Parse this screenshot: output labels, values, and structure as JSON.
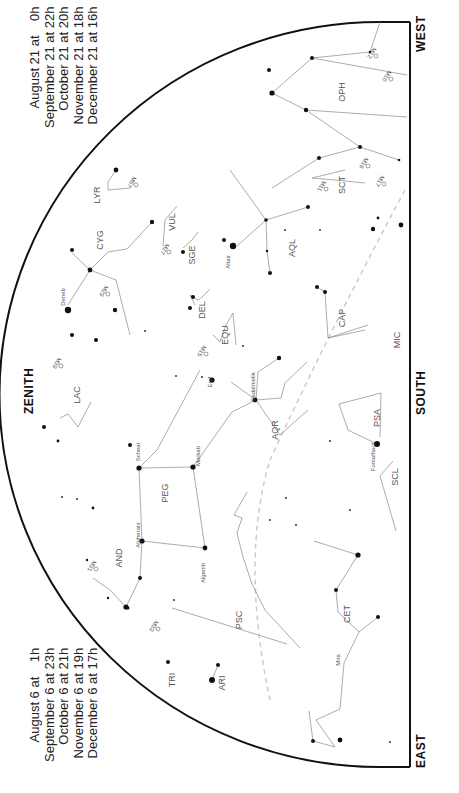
{
  "chart": {
    "title": "",
    "directions": {
      "zenith": "ZENITH",
      "south": "SOUTH",
      "west": "WEST",
      "east": "EAST"
    },
    "times_top": [
      "August 21 at    0h",
      "September 21 at 22h",
      "October 21 at 20h",
      "November 21 at 18h",
      "December 21 at 16h"
    ],
    "times_bottom": [
      "August 6 at    1h",
      "September 6 at 23h",
      "October 6 at 21h",
      "November 6 at 19h",
      "December 6 at 17h"
    ],
    "colors": {
      "border": "#111111",
      "lines": "#888888",
      "stars": "#111111",
      "ecliptic": "#cccccc",
      "labels": "#555555"
    }
  },
  "constellations": [
    {
      "abbr": "OPH",
      "x": 345,
      "y": 92
    },
    {
      "abbr": "SCT",
      "x": 345,
      "y": 185
    },
    {
      "abbr": "AQL",
      "x": 295,
      "y": 248
    },
    {
      "abbr": "CAP",
      "x": 345,
      "y": 318
    },
    {
      "abbr": "MIC",
      "x": 400,
      "y": 340
    },
    {
      "abbr": "LYR",
      "x": 100,
      "y": 195
    },
    {
      "abbr": "CYG",
      "x": 103,
      "y": 240
    },
    {
      "abbr": "VUL",
      "x": 175,
      "y": 222
    },
    {
      "abbr": "SGE",
      "x": 195,
      "y": 255
    },
    {
      "abbr": "DEL",
      "x": 205,
      "y": 310
    },
    {
      "abbr": "EQU",
      "x": 228,
      "y": 335
    },
    {
      "abbr": "LAC",
      "x": 80,
      "y": 395
    },
    {
      "abbr": "AQR",
      "x": 278,
      "y": 430
    },
    {
      "abbr": "PSA",
      "x": 380,
      "y": 418
    },
    {
      "abbr": "PEG",
      "x": 168,
      "y": 493
    },
    {
      "abbr": "SCL",
      "x": 398,
      "y": 477
    },
    {
      "abbr": "AND",
      "x": 122,
      "y": 558
    },
    {
      "abbr": "PSC",
      "x": 242,
      "y": 620
    },
    {
      "abbr": "CET",
      "x": 350,
      "y": 614
    },
    {
      "abbr": "ARI",
      "x": 225,
      "y": 683
    },
    {
      "abbr": "TRI",
      "x": 175,
      "y": 680
    }
  ],
  "star_names": [
    {
      "name": "Altair",
      "x": 230,
      "y": 262
    },
    {
      "name": "Deneb",
      "x": 65,
      "y": 297
    },
    {
      "name": "Sadalmelik",
      "x": 255,
      "y": 387
    },
    {
      "name": "Fomalhaut",
      "x": 375,
      "y": 457
    },
    {
      "name": "Scheat",
      "x": 140,
      "y": 452
    },
    {
      "name": "Markab",
      "x": 200,
      "y": 456
    },
    {
      "name": "Alpheratz",
      "x": 140,
      "y": 535
    },
    {
      "name": "Algenib",
      "x": 205,
      "y": 573
    },
    {
      "name": "Mira",
      "x": 340,
      "y": 660
    },
    {
      "name": "Enif",
      "x": 212,
      "y": 382
    }
  ],
  "deep_sky": [
    {
      "name": "M10",
      "x": 385,
      "y": 75
    },
    {
      "name": "M12",
      "x": 370,
      "y": 52
    },
    {
      "name": "M11",
      "x": 320,
      "y": 185
    },
    {
      "name": "M16",
      "x": 362,
      "y": 162
    },
    {
      "name": "M17",
      "x": 378,
      "y": 180
    },
    {
      "name": "M57",
      "x": 130,
      "y": 181
    },
    {
      "name": "M27",
      "x": 163,
      "y": 248
    },
    {
      "name": "M29",
      "x": 102,
      "y": 290
    },
    {
      "name": "M15",
      "x": 200,
      "y": 350
    },
    {
      "name": "M39",
      "x": 55,
      "y": 362
    },
    {
      "name": "M31",
      "x": 90,
      "y": 565
    },
    {
      "name": "M33",
      "x": 152,
      "y": 625
    }
  ]
}
